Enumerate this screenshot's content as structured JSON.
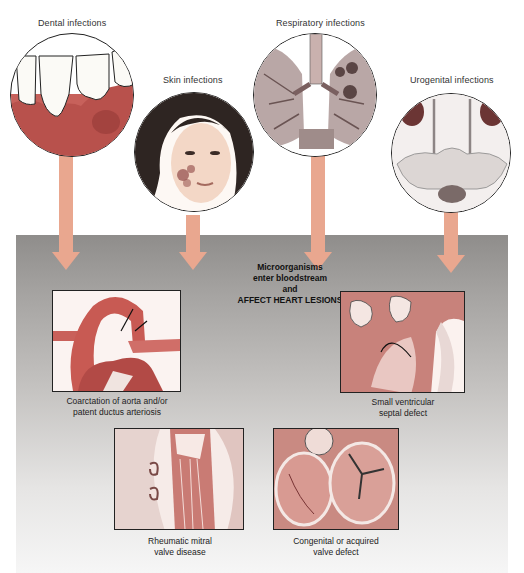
{
  "sources": [
    {
      "id": "dental",
      "label": "Dental infections"
    },
    {
      "id": "skin",
      "label": "Skin infections"
    },
    {
      "id": "respiratory",
      "label": "Respiratory infections"
    },
    {
      "id": "urogenital",
      "label": "Urogenital infections"
    }
  ],
  "center": {
    "line1": "Microorganisms",
    "line2": "enter bloodstream",
    "line3": "and",
    "line4": "AFFECT HEART LESIONS"
  },
  "lesions": [
    {
      "id": "coarctation",
      "caption_line1": "Coarctation of aorta and/or",
      "caption_line2": "patent ductus arteriosis"
    },
    {
      "id": "vsd",
      "caption_line1": "Small ventricular",
      "caption_line2": "septal defect"
    },
    {
      "id": "rheumatic",
      "caption_line1": "Rheumatic mitral",
      "caption_line2": "valve disease"
    },
    {
      "id": "congenital",
      "caption_line1": "Congenital or acquired",
      "caption_line2": "valve defect"
    }
  ],
  "colors": {
    "arrow": "#e9a78f",
    "panel_top": "#8f8d8b",
    "panel_bottom": "#f6f6f6",
    "tissue": "#c9685f"
  }
}
